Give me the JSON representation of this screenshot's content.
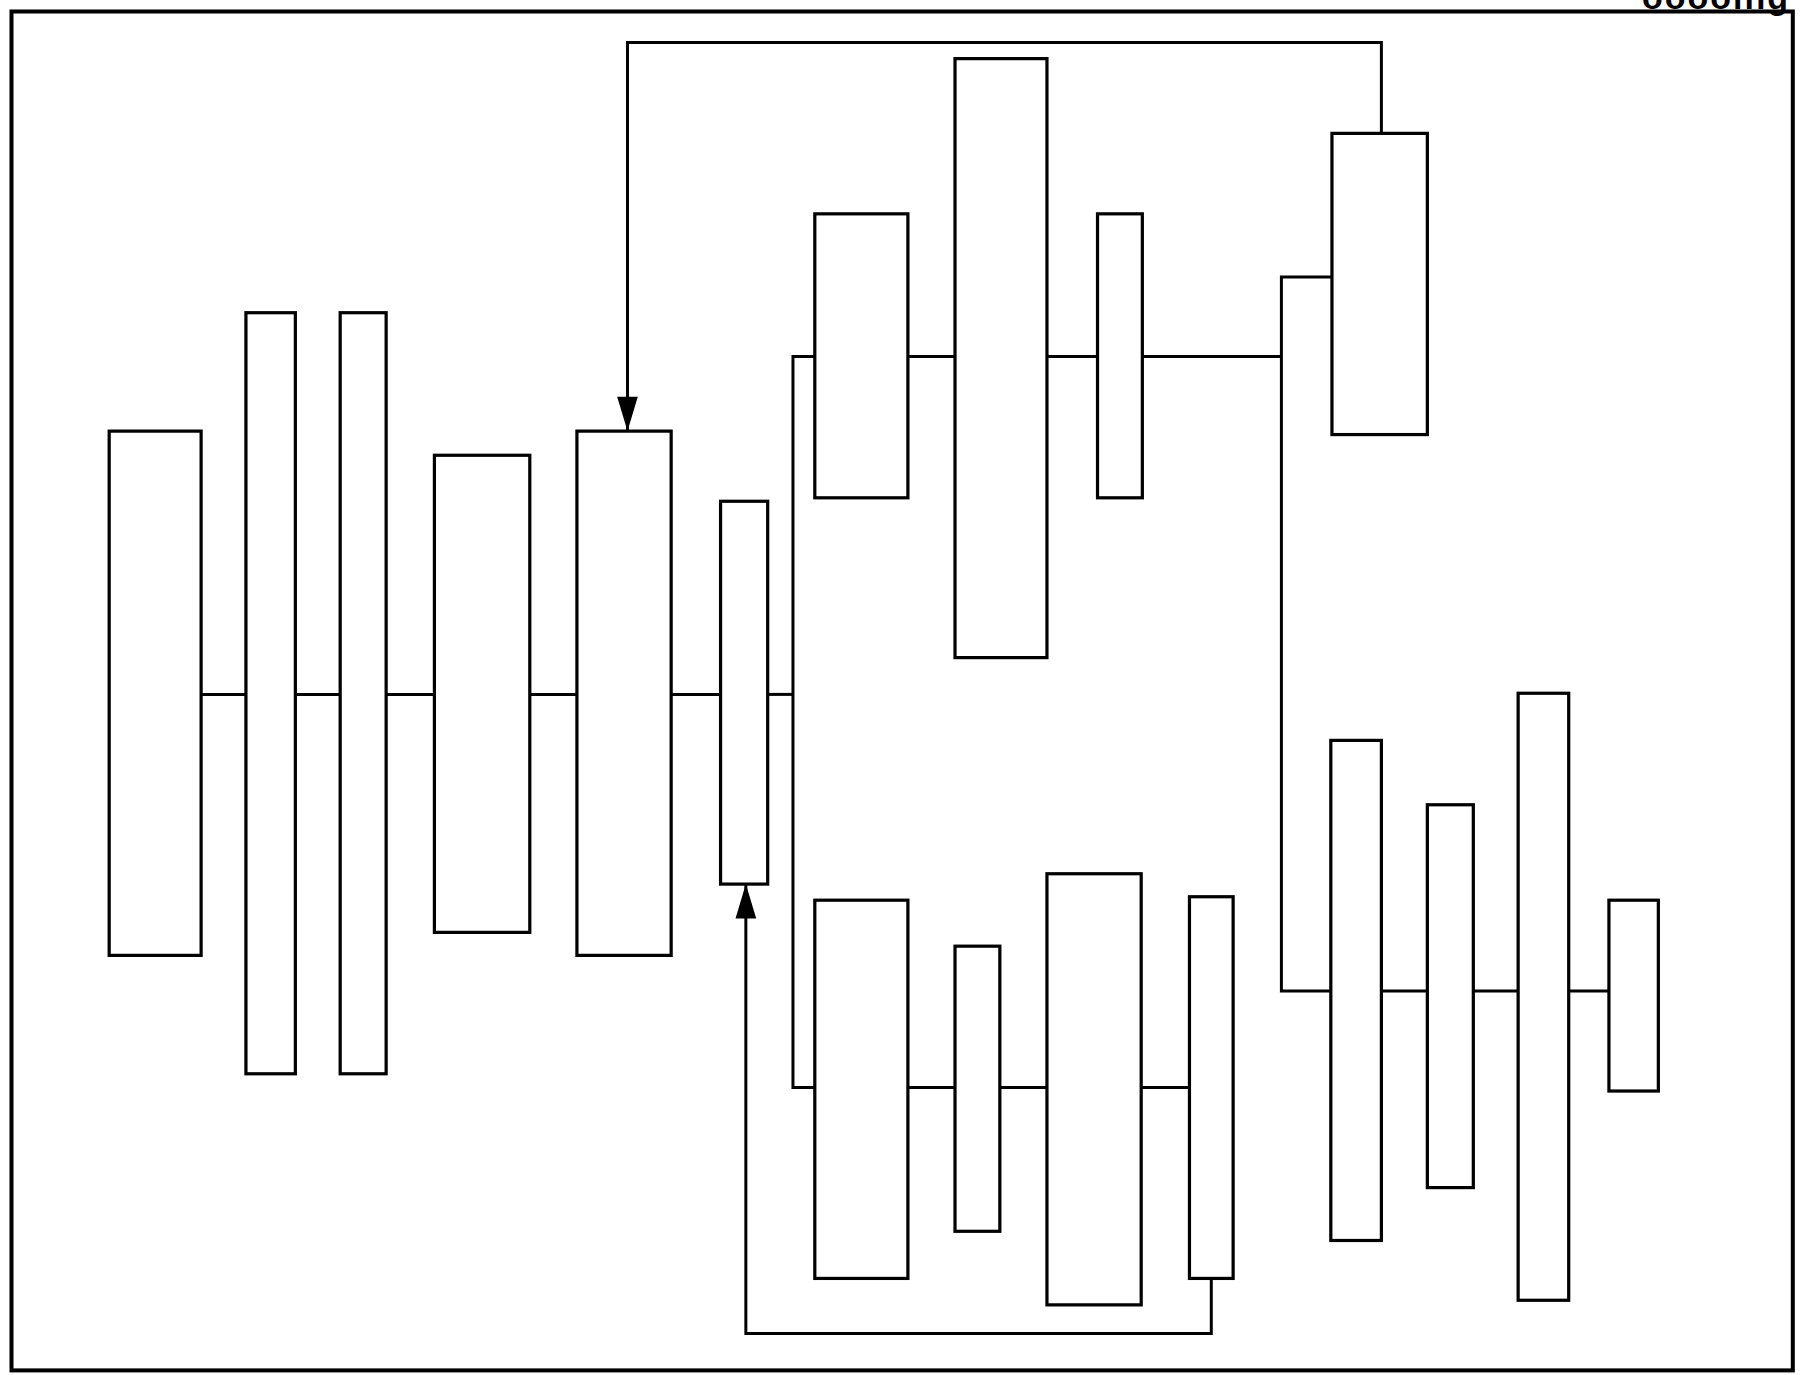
{
  "figure": {
    "caption_fragment": "ooooing",
    "stroke_color": "#000000",
    "background_color": "#ffffff",
    "frame": {
      "x": 10,
      "y": 10,
      "w": 1550,
      "h": 1182
    }
  },
  "diagram": {
    "type": "block-connection-diagram",
    "main_chain": {
      "line_y": 604,
      "blocks": [
        {
          "id": "A",
          "x": 95,
          "y": 375,
          "w": 80,
          "h": 456
        },
        {
          "id": "B",
          "x": 214,
          "y": 272,
          "w": 43,
          "h": 662
        },
        {
          "id": "C",
          "x": 296,
          "y": 272,
          "w": 40,
          "h": 662
        },
        {
          "id": "D",
          "x": 378,
          "y": 396,
          "w": 83,
          "h": 415
        },
        {
          "id": "E",
          "x": 502,
          "y": 375,
          "w": 82,
          "h": 456
        },
        {
          "id": "F",
          "x": 627,
          "y": 436,
          "w": 41,
          "h": 333
        }
      ]
    },
    "upper_chain": {
      "line_y": 310,
      "blocks": [
        {
          "id": "G",
          "x": 709,
          "y": 186,
          "w": 81,
          "h": 247
        },
        {
          "id": "H",
          "x": 831,
          "y": 51,
          "w": 80,
          "h": 521
        },
        {
          "id": "I",
          "x": 955,
          "y": 186,
          "w": 39,
          "h": 247
        },
        {
          "id": "J",
          "x": 1159,
          "y": 116,
          "w": 83,
          "h": 262
        }
      ]
    },
    "lower_chain": {
      "line_y": 946,
      "blocks": [
        {
          "id": "K",
          "x": 709,
          "y": 783,
          "w": 81,
          "h": 329
        },
        {
          "id": "L",
          "x": 831,
          "y": 823,
          "w": 39,
          "h": 248
        },
        {
          "id": "M",
          "x": 911,
          "y": 760,
          "w": 82,
          "h": 375
        },
        {
          "id": "N",
          "x": 1035,
          "y": 780,
          "w": 38,
          "h": 332
        }
      ]
    },
    "right_chain": {
      "line_y": 862,
      "blocks": [
        {
          "id": "O",
          "x": 1158,
          "y": 644,
          "w": 44,
          "h": 435
        },
        {
          "id": "P",
          "x": 1242,
          "y": 700,
          "w": 40,
          "h": 333
        },
        {
          "id": "Q",
          "x": 1321,
          "y": 603,
          "w": 44,
          "h": 528
        },
        {
          "id": "R",
          "x": 1400,
          "y": 783,
          "w": 43,
          "h": 166
        }
      ]
    },
    "feedback_arrows": [
      {
        "name": "top-feedback",
        "from": "J",
        "to": "E",
        "path": [
          [
            1202,
            116
          ],
          [
            1202,
            37
          ],
          [
            546,
            37
          ],
          [
            546,
            375
          ]
        ],
        "direction": "down"
      },
      {
        "name": "bottom-feedback",
        "from": "N",
        "to": "F",
        "path": [
          [
            1054,
            1112
          ],
          [
            1054,
            1160
          ],
          [
            649,
            1160
          ],
          [
            649,
            769
          ]
        ],
        "direction": "up"
      }
    ]
  }
}
